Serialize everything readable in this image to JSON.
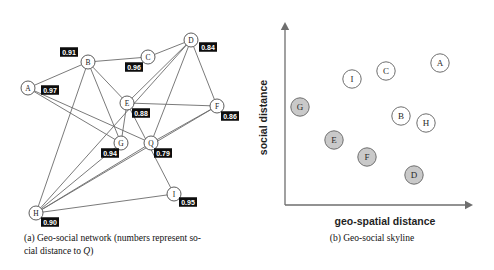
{
  "figure": {
    "panel_a": {
      "caption_line1": "(a) Geo-social network (numbers represent so-",
      "caption_line2_prefix": "cial distance to ",
      "caption_line2_italic": "Q",
      "caption_line2_suffix": ")",
      "nodes": [
        {
          "id": "A",
          "label": "A",
          "x": 28,
          "y": 88,
          "dist": "0.97",
          "dist_x": 50,
          "dist_y": 90
        },
        {
          "id": "B",
          "label": "B",
          "x": 88,
          "y": 62,
          "dist": "0.91",
          "dist_x": 69,
          "dist_y": 52
        },
        {
          "id": "C",
          "label": "C",
          "x": 148,
          "y": 57,
          "dist": "0.96",
          "dist_x": 134,
          "dist_y": 67
        },
        {
          "id": "D",
          "label": "D",
          "x": 191,
          "y": 40,
          "dist": "0.84",
          "dist_x": 208,
          "dist_y": 47
        },
        {
          "id": "E",
          "label": "E",
          "x": 127,
          "y": 103,
          "dist": "0.88",
          "dist_x": 141,
          "dist_y": 113
        },
        {
          "id": "F",
          "label": "F",
          "x": 217,
          "y": 106,
          "dist": "0.86",
          "dist_x": 230,
          "dist_y": 116
        },
        {
          "id": "G",
          "label": "G",
          "x": 121,
          "y": 143,
          "dist": "0.94",
          "dist_x": 110,
          "dist_y": 153
        },
        {
          "id": "Q",
          "label": "Q",
          "x": 151,
          "y": 143,
          "dist": "0.79",
          "dist_x": 163,
          "dist_y": 153
        },
        {
          "id": "H",
          "label": "H",
          "x": 36,
          "y": 213,
          "dist": "0.90",
          "dist_x": 50,
          "dist_y": 222
        },
        {
          "id": "I",
          "label": "I",
          "x": 174,
          "y": 194,
          "dist": "0.95",
          "dist_x": 188,
          "dist_y": 202
        }
      ],
      "edges": [
        [
          "A",
          "B"
        ],
        [
          "A",
          "G"
        ],
        [
          "A",
          "Q"
        ],
        [
          "B",
          "C"
        ],
        [
          "B",
          "E"
        ],
        [
          "B",
          "G"
        ],
        [
          "B",
          "H"
        ],
        [
          "C",
          "D"
        ],
        [
          "D",
          "E"
        ],
        [
          "D",
          "F"
        ],
        [
          "D",
          "Q"
        ],
        [
          "D",
          "H"
        ],
        [
          "E",
          "F"
        ],
        [
          "E",
          "G"
        ],
        [
          "E",
          "I"
        ],
        [
          "F",
          "Q"
        ],
        [
          "F",
          "H"
        ],
        [
          "G",
          "H"
        ],
        [
          "Q",
          "H"
        ],
        [
          "H",
          "I"
        ]
      ]
    },
    "panel_b": {
      "caption": "(b) Geo-social skyline",
      "xlabel": "geo-spatial distance",
      "ylabel": "social distance",
      "points": [
        {
          "id": "G",
          "label": "G",
          "x": 300,
          "y": 107,
          "filled": true
        },
        {
          "id": "I",
          "label": "I",
          "x": 352,
          "y": 79,
          "filled": false
        },
        {
          "id": "C",
          "label": "C",
          "x": 386,
          "y": 71,
          "filled": false
        },
        {
          "id": "A",
          "label": "A",
          "x": 440,
          "y": 63,
          "filled": false
        },
        {
          "id": "E",
          "label": "E",
          "x": 334,
          "y": 140,
          "filled": true
        },
        {
          "id": "B",
          "label": "B",
          "x": 401,
          "y": 116,
          "filled": false
        },
        {
          "id": "H",
          "label": "H",
          "x": 426,
          "y": 123,
          "filled": false
        },
        {
          "id": "F",
          "label": "F",
          "x": 367,
          "y": 157,
          "filled": true
        },
        {
          "id": "D",
          "label": "D",
          "x": 414,
          "y": 175,
          "filled": true
        }
      ]
    }
  },
  "chart_data": {
    "type": "scatter",
    "title": "",
    "xlabel": "geo-spatial distance",
    "ylabel": "social distance",
    "grid": false,
    "legend": "none",
    "axis_style": "arrow-axes-unlabeled-ticks",
    "series": [
      {
        "name": "skyline points (shaded)",
        "points": [
          {
            "label": "G",
            "x": 0.13,
            "y": 0.56
          },
          {
            "label": "E",
            "x": 0.29,
            "y": 0.33
          },
          {
            "label": "F",
            "x": 0.5,
            "y": 0.22
          },
          {
            "label": "D",
            "x": 0.78,
            "y": 0.09
          }
        ]
      },
      {
        "name": "dominated points (white)",
        "points": [
          {
            "label": "I",
            "x": 0.42,
            "y": 0.83
          },
          {
            "label": "C",
            "x": 0.63,
            "y": 0.88
          },
          {
            "label": "A",
            "x": 0.92,
            "y": 0.92
          },
          {
            "label": "B",
            "x": 0.73,
            "y": 0.49
          },
          {
            "label": "H",
            "x": 0.86,
            "y": 0.44
          }
        ]
      }
    ],
    "xlim": [
      0,
      1
    ],
    "ylim": [
      0,
      1
    ]
  }
}
